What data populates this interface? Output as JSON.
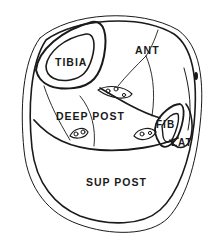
{
  "diagram": {
    "type": "anatomical cross-section",
    "labels": {
      "tibia": "TIBIA",
      "ant": "ANT",
      "deep_post": "DEEP POST",
      "fib": "FIB",
      "lat": "LAT",
      "sup_post": "SUP POST"
    },
    "colors": {
      "line": "#1a1a1a",
      "background": "#ffffff"
    }
  }
}
